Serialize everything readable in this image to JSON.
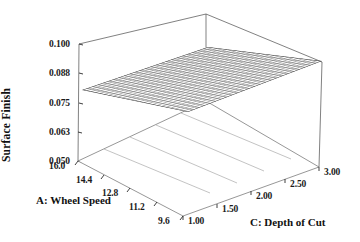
{
  "chart_data": {
    "type": "surface3d",
    "title": "",
    "zlabel": "Surface Finish",
    "xlabel": "A: Wheel Speed",
    "ylabel": "C: Depth of Cut",
    "z_ticks": [
      "0.100",
      "0.088",
      "0.075",
      "0.063",
      "0.050"
    ],
    "z_values": [
      0.1,
      0.088,
      0.075,
      0.063,
      0.05
    ],
    "zlim": [
      0.05,
      0.1
    ],
    "x_ticks": [
      "16.0",
      "14.4",
      "12.8",
      "11.2",
      "9.6"
    ],
    "x_values": [
      16.0,
      14.4,
      12.8,
      11.2,
      9.6
    ],
    "xlim": [
      9.6,
      16.0
    ],
    "y_ticks": [
      "1.00",
      "1.50",
      "2.00",
      "2.50",
      "3.00"
    ],
    "y_values": [
      1.0,
      1.5,
      2.0,
      2.5,
      3.0
    ],
    "ylim": [
      1.0,
      3.0
    ],
    "grid": true,
    "legend": "none",
    "surface": {
      "description": "Near-planar wireframe mesh rising slightly from the low wheel-speed / low depth-of-cut front corner toward the high wheel-speed / high depth-of-cut back corner.",
      "mesh_rows": 24,
      "mesh_cols": 24,
      "corner_values": {
        "wheelspeed_16.0_depth_1.00": 0.063,
        "wheelspeed_9.6_depth_1.00": 0.064,
        "wheelspeed_16.0_depth_3.00": 0.083,
        "wheelspeed_9.6_depth_3.00": 0.086
      },
      "series": [
        {
          "name": "Depth of Cut = 1.00",
          "x": [
            16.0,
            14.4,
            12.8,
            11.2,
            9.6
          ],
          "z": [
            0.063,
            0.063,
            0.064,
            0.064,
            0.064
          ]
        },
        {
          "name": "Depth of Cut = 1.50",
          "x": [
            16.0,
            14.4,
            12.8,
            11.2,
            9.6
          ],
          "z": [
            0.068,
            0.068,
            0.069,
            0.069,
            0.07
          ]
        },
        {
          "name": "Depth of Cut = 2.00",
          "x": [
            16.0,
            14.4,
            12.8,
            11.2,
            9.6
          ],
          "z": [
            0.073,
            0.074,
            0.074,
            0.075,
            0.075
          ]
        },
        {
          "name": "Depth of Cut = 2.50",
          "x": [
            16.0,
            14.4,
            12.8,
            11.2,
            9.6
          ],
          "z": [
            0.078,
            0.079,
            0.079,
            0.08,
            0.081
          ]
        },
        {
          "name": "Depth of Cut = 3.00",
          "x": [
            16.0,
            14.4,
            12.8,
            11.2,
            9.6
          ],
          "z": [
            0.083,
            0.084,
            0.085,
            0.085,
            0.086
          ]
        }
      ]
    },
    "floor_contours": 4,
    "colors": {
      "mesh": "#555555",
      "axis": "#3a3a3a",
      "floor_line": "#888888",
      "text": "#111111",
      "background": "#ffffff"
    }
  },
  "axes": {
    "z": {
      "title": "Surface Finish",
      "ticks": [
        "0.100",
        "0.088",
        "0.075",
        "0.063",
        "0.050"
      ]
    },
    "x": {
      "title": "A: Wheel Speed",
      "ticks": [
        "16.0",
        "14.4",
        "12.8",
        "11.2",
        "9.6"
      ]
    },
    "y": {
      "title": "C: Depth of Cut",
      "ticks": [
        "1.00",
        "1.50",
        "2.00",
        "2.50",
        "3.00"
      ]
    }
  }
}
